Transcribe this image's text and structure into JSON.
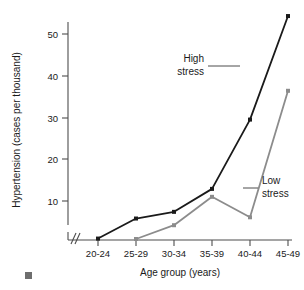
{
  "chart_data": {
    "type": "line",
    "title": "",
    "xlabel": "Age group (years)",
    "ylabel": "Hypertension (cases per thousand)",
    "categories": [
      "20-24",
      "25-29",
      "30-34",
      "35-39",
      "40-44",
      "45-49"
    ],
    "yticks": [
      10,
      20,
      30,
      40,
      50
    ],
    "ylim": [
      0,
      56
    ],
    "grid": false,
    "legend_position": "inline-annotation",
    "axis_break": true,
    "axis_break_symbol": "//",
    "series": [
      {
        "name": "High stress",
        "color": "#1a1a1a",
        "marker": "square",
        "values": [
          1.0,
          5.8,
          7.4,
          12.9,
          29.5,
          54.3
        ]
      },
      {
        "name": "Low stress",
        "color": "#8c8c8c",
        "marker": "square",
        "values": [
          null,
          0.9,
          4.2,
          11.0,
          6.1,
          36.4
        ]
      }
    ],
    "annotations": [
      {
        "text_line1": "High",
        "text_line2": "stress",
        "target_series": "High stress"
      },
      {
        "text_line1": "Low",
        "text_line2": "stress",
        "target_series": "Low stress"
      }
    ]
  },
  "axis": {
    "y_title": "Hypertension (cases per thousand)",
    "x_title": "Age group (years)",
    "ytick_0": "10",
    "ytick_1": "20",
    "ytick_2": "30",
    "ytick_3": "40",
    "ytick_4": "50",
    "xtick_0": "20-24",
    "xtick_1": "25-29",
    "xtick_2": "30-34",
    "xtick_3": "35-39",
    "xtick_4": "40-44",
    "xtick_5": "45-49"
  },
  "annotations": {
    "high_stress_line1": "High",
    "high_stress_line2": "stress",
    "low_stress_line1": "Low",
    "low_stress_line2": "stress"
  },
  "colors": {
    "high_stress": "#1a1a1a",
    "low_stress": "#8c8c8c",
    "axis": "#4d4d4d",
    "background": "#ffffff"
  }
}
